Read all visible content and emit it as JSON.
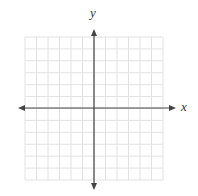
{
  "diagram": {
    "type": "coordinate-plane",
    "x_axis_label": "x",
    "y_axis_label": "y",
    "grid": {
      "columns": 12,
      "rows": 12,
      "left": 25,
      "top": 37,
      "right": 163,
      "bottom": 180,
      "line_color": "#e2e2e2"
    },
    "axes": {
      "color": "#444444",
      "origin_x": 94,
      "origin_y": 108,
      "x_arrow_left": 18,
      "x_arrow_right": 176,
      "y_arrow_top": 29,
      "y_arrow_bottom": 190
    },
    "tick_labels": []
  }
}
